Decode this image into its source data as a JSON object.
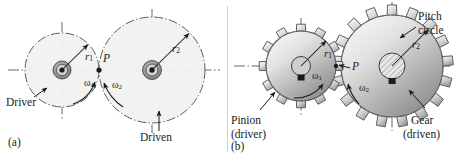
{
  "figure": {
    "width": 457,
    "height": 158,
    "background": "#ffffff",
    "ink": "#1b1b1b"
  },
  "colors": {
    "wheel_fill": "#f0f0f0",
    "wheel_stroke": "#6e6e6e",
    "centerline": "#555555",
    "gear_light": "#f4f4f4",
    "gear_mid": "#bdbdbd",
    "gear_dark": "#8a8a8a",
    "hub_dark": "#1b1b1b",
    "ink": "#1b1b1b"
  },
  "panel_a": {
    "caption": "(a)",
    "driver_label": "Driver",
    "driven_label": "Driven",
    "pitch_point": "P",
    "radius_small": "r",
    "radius_small_sub": "1",
    "radius_large": "r",
    "radius_large_sub": "2",
    "omega_small": "ω",
    "omega_small_sub": "1",
    "omega_large": "ω",
    "omega_large_sub": "2",
    "small_wheel": {
      "cx": 62,
      "cy": 70,
      "r": 37
    },
    "large_wheel": {
      "cx": 152,
      "cy": 70,
      "r": 53
    }
  },
  "panel_b": {
    "caption": "(b)",
    "pinion_label_line1": "Pinion",
    "pinion_label_line2": "(driver)",
    "gear_label_line1": "Gear",
    "gear_label_line2": "(driven)",
    "pitch_circle_label_line1": "Pitch",
    "pitch_circle_label_line2": "circle",
    "pitch_point": "P",
    "radius_small": "r",
    "radius_small_sub": "1",
    "radius_large": "r",
    "radius_large_sub": "2",
    "omega_small": "ω",
    "omega_small_sub": "1",
    "omega_large": "ω",
    "omega_large_sub": "2",
    "pinion": {
      "cx": 73,
      "cy": 66,
      "pitch_r": 35,
      "teeth": 12
    },
    "gear": {
      "cx": 164,
      "cy": 66,
      "pitch_r": 51,
      "teeth": 17
    }
  }
}
